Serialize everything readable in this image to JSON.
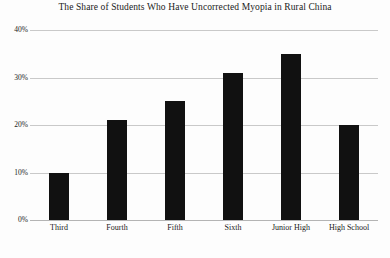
{
  "chart_data": {
    "type": "bar",
    "title": "The Share of Students Who Have Uncorrected Myopia in Rural China",
    "subtitle": "",
    "xlabel": "",
    "ylabel": "",
    "categories": [
      "Third",
      "Fourth",
      "Fifth",
      "Sixth",
      "Junior High",
      "High School"
    ],
    "values": [
      10,
      21,
      25,
      31,
      35,
      20
    ],
    "value_labels": [
      "10%",
      "21%",
      "25%",
      "31%",
      "35%",
      "20%"
    ],
    "ylim": [
      0,
      40
    ],
    "ytick_values": [
      0,
      10,
      20,
      30,
      40
    ],
    "ytick_labels": [
      "0%",
      "10%",
      "20%",
      "30%",
      "40%"
    ],
    "grid": true,
    "grid_axis": "y",
    "legend": false,
    "legend_position": "none",
    "bar_color": "#111111",
    "grid_color": "#c9c9c9",
    "background_color": "#fdfdfd",
    "text_color": "#1b1b1b"
  }
}
